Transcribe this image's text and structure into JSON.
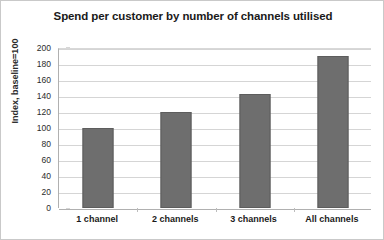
{
  "chart_data": {
    "type": "bar",
    "title": "Spend per customer by number of channels utilised",
    "xlabel": "",
    "ylabel": "Index, baseline=100",
    "categories": [
      "1 channel",
      "2 channels",
      "3 channels",
      "All channels"
    ],
    "values": [
      100,
      120,
      142,
      190
    ],
    "ylim": [
      0,
      200
    ],
    "ytick_step": 20,
    "yticks": [
      0,
      20,
      40,
      60,
      80,
      100,
      120,
      140,
      160,
      180,
      200
    ],
    "ytick_labels": [
      "0",
      "20",
      "40",
      "60",
      "80",
      "100",
      "120",
      "140",
      "160",
      "180",
      "200"
    ],
    "grid": true,
    "legend": false,
    "series": [
      {
        "name": "Spend index",
        "values": [
          100,
          120,
          142,
          190
        ],
        "color": "#6e6e6e"
      }
    ],
    "colors": {
      "bar_fill": "#6e6e6e",
      "bar_border": "#5d5d5d",
      "gridline": "#d5d5d5",
      "axis": "#b0b0b0",
      "text": "#1a1a1a",
      "background": "#ffffff",
      "frame_border": "#c9c9c9"
    }
  }
}
